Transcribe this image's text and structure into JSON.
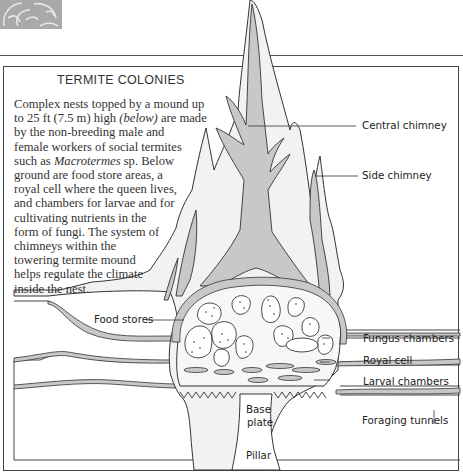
{
  "diagram": {
    "title": "TERMITE COLONIES",
    "description_lines": [
      "Complex nests topped by a mound up",
      "to 25 ft (7.5 m) high ",
      "(below)",
      " are made",
      "by the non-breeding male and",
      "female workers of social termites",
      "such as ",
      "Macrotermes",
      " sp. Below",
      "ground are food store areas, a",
      "royal cell where the queen lives,",
      "and chambers for larvae and for",
      "cultivating nutrients in the",
      "form of fungi. The system of",
      "chimneys within the",
      "towering termite mound",
      "helps regulate the climate",
      "inside the nest."
    ],
    "labels": {
      "central_chimney": "Central chimney",
      "side_chimney": "Side chimney",
      "food_stores": "Food stores",
      "fungus_chambers": "Fungus chambers",
      "royal_cell": "Royal cell",
      "larval_chambers": "Larval chambers",
      "base_plate_1": "Base",
      "base_plate_2": "plate",
      "foraging_tunnels": "Foraging tunnels",
      "pillar": "Pillar"
    },
    "colors": {
      "mound_fill": "#f2f2f2",
      "chimney_fill": "#c8c8c8",
      "outline": "#333333",
      "ornament": "#a9a9a9",
      "soil": "#ffffff"
    }
  }
}
